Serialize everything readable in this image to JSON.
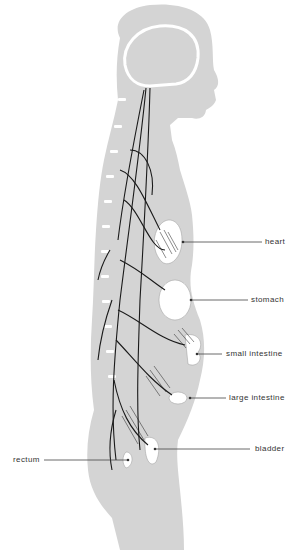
{
  "diagram": {
    "type": "anatomical illustration",
    "colors": {
      "silhouette": "#d4d4d4",
      "organs": "#ffffff",
      "nerves": "#1a1a1a",
      "leader_lines": "#444444",
      "label_text": "#333333"
    },
    "labels": [
      {
        "id": "heart",
        "text": "heart"
      },
      {
        "id": "stomach",
        "text": "stomach"
      },
      {
        "id": "small_intestine",
        "text": "small intestine"
      },
      {
        "id": "large_intestine",
        "text": "large intestine"
      },
      {
        "id": "bladder",
        "text": "bladder"
      },
      {
        "id": "rectum",
        "text": "rectum"
      }
    ]
  }
}
